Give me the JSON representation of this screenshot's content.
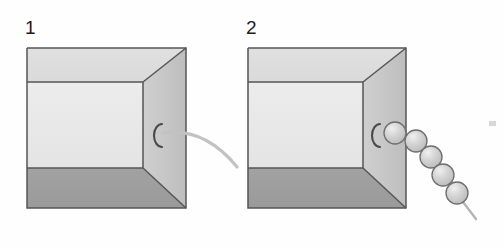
{
  "figure": {
    "type": "two-panel-diagram",
    "background_color": "#fefefe",
    "description_visible_text": [
      "1",
      "2"
    ]
  },
  "panels": [
    {
      "label": "1",
      "label_x": 25,
      "label_y": 18,
      "box": {
        "name": "open-box-perspective",
        "outer_left": 27,
        "outer_top": 48,
        "outer_right": 186,
        "outer_bottom": 208,
        "inner_top": 82,
        "inner_bottom": 168,
        "inner_right": 143,
        "colors": {
          "back_wall": "#e8e8e8",
          "top_wall": "#dddddd",
          "floor": "#9e9e9e",
          "right_wall": "#c9c9c9",
          "outline": "#555555"
        }
      },
      "hole": {
        "name": "hole-opening",
        "glyph": "C",
        "cx": 156,
        "cy": 135,
        "rx": 8,
        "ry": 12,
        "color": "#4a4a4a"
      },
      "emerging": {
        "name": "smooth-curve",
        "kind": "curve",
        "color": "#c2c2c2",
        "stroke_width": 3.2,
        "path": "M 163 133 C 190 129, 215 140, 237 167"
      }
    },
    {
      "label": "2",
      "label_x": 246,
      "label_y": 18,
      "box": {
        "name": "open-box-perspective",
        "outer_left": 248,
        "outer_top": 48,
        "outer_right": 406,
        "outer_bottom": 208,
        "inner_top": 82,
        "inner_bottom": 168,
        "inner_right": 363,
        "colors": {
          "back_wall": "#e8e8e8",
          "top_wall": "#dddddd",
          "floor": "#9e9e9e",
          "right_wall": "#c9c9c9",
          "outline": "#555555"
        }
      },
      "hole": {
        "name": "hole-opening",
        "glyph": "C",
        "cx": 374,
        "cy": 135,
        "rx": 8,
        "ry": 12,
        "color": "#4a4a4a"
      },
      "emerging": {
        "name": "sphere-chain",
        "kind": "beads",
        "count": 5,
        "fill": "#cdcdcd",
        "highlight": "#eaeaea",
        "outline": "#6e6e6e",
        "beads": [
          {
            "cx": 395,
            "cy": 133,
            "r": 11
          },
          {
            "cx": 416,
            "cy": 141,
            "r": 11
          },
          {
            "cx": 431,
            "cy": 157,
            "r": 11
          },
          {
            "cx": 443,
            "cy": 175,
            "r": 11
          },
          {
            "cx": 457,
            "cy": 193,
            "r": 11
          }
        ],
        "tail": {
          "name": "chain-tail",
          "color": "#b4b4b4",
          "stroke_width": 2.4,
          "path": "M 463 202 L 476 219"
        }
      }
    }
  ],
  "marks": [
    {
      "name": "edge-artifact-mark",
      "x": 489,
      "y": 121,
      "width": 7,
      "height": 5,
      "color": "#d8d8d8"
    }
  ]
}
